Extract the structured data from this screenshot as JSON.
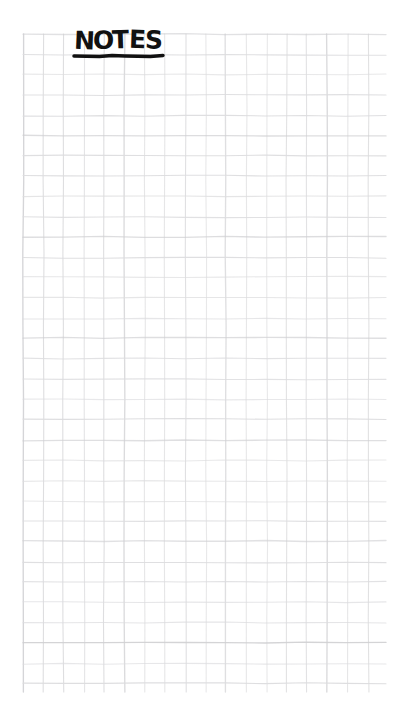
{
  "page": {
    "kind": "graph-paper-notepad-page",
    "width": 405,
    "height": 723,
    "background_color": "#ffffff",
    "paper_color": "#ffffff"
  },
  "heading": {
    "text": "NOTES",
    "style": "hand-lettered marker capitals",
    "color": "#111111",
    "underline": true,
    "underline_color": "#111111",
    "left": 74,
    "top": 28,
    "underline_left": 74,
    "underline_right": 163,
    "underline_y": 56,
    "underline_thickness": 3.5
  },
  "grid": {
    "left": 23,
    "top": 34,
    "right": 386,
    "bottom": 692,
    "columns": 18,
    "rows": 32,
    "cell_size": 20.3,
    "line_color": "#dcdcde",
    "line_color_strong": "#cfcfd2",
    "line_width": 1.1,
    "style": "hand-drawn wavy square grid"
  }
}
